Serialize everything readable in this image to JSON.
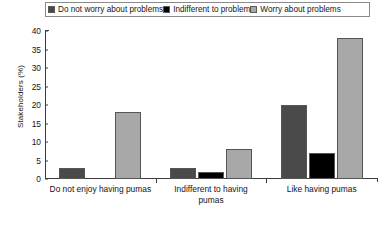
{
  "chart_data": {
    "type": "bar",
    "title": "",
    "xlabel": "",
    "ylabel": "Stakeholders (%)",
    "categories": [
      "Do not enjoy having pumas",
      "Indifferent to having\npumas",
      "Like having pumas"
    ],
    "series": [
      {
        "name": "Do not worry about problems",
        "color": "#4a4a4a",
        "values": [
          3,
          3,
          20
        ]
      },
      {
        "name": "Indifferent to problem",
        "color": "#000000",
        "values": [
          0,
          2,
          7
        ]
      },
      {
        "name": "Worry about problems",
        "color": "#a8a8a8",
        "values": [
          18,
          8,
          38
        ]
      }
    ],
    "ylim": [
      0,
      40
    ],
    "yticks": [
      0,
      5,
      10,
      15,
      20,
      25,
      30,
      35,
      40
    ],
    "ytick_labels": [
      "0",
      "5",
      "10",
      "15",
      "20",
      "25",
      "30",
      "35",
      "40"
    ],
    "grid": false,
    "legend_position": "top"
  }
}
